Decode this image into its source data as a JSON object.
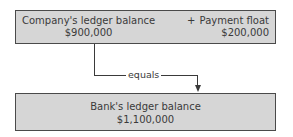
{
  "diagram": {
    "top_box": {
      "left_term": {
        "label": "Company's ledger balance",
        "value": "$900,000"
      },
      "operator": "+",
      "right_term": {
        "label": "Payment float",
        "value": "$200,000"
      }
    },
    "connector": {
      "label": "equals"
    },
    "bottom_box": {
      "label": "Bank's ledger balance",
      "value": "$1,100,000"
    }
  }
}
